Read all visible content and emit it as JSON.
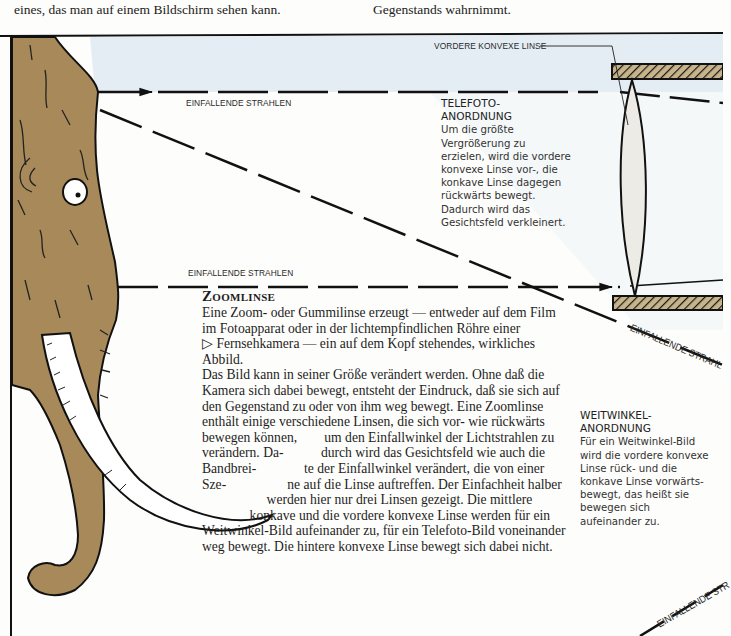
{
  "page_top": {
    "left_fragment": "eines, das man auf einem Bildschirm sehen kann.",
    "right_fragment": "Gegenstands wahrnimmt."
  },
  "diagram": {
    "labels": {
      "front_lens": "VORDERE KONVEXE LINSE",
      "rays_top": "EINFALLENDE STRAHLEN",
      "rays_middle": "EINFALLENDE STRAHLEN",
      "rays_diagonal_right": "EINFALLENDE STRAHL",
      "rays_bottom_right": "EINFALLENDE STR"
    },
    "colors": {
      "sky_band": "#e3edf3",
      "mammoth_fur": "#a88a5a",
      "tusk": "#ffffff",
      "lens_fill": "#ecebe6",
      "housing_hatch": "#c7b48a",
      "ink": "#111111"
    }
  },
  "telefoto": {
    "title": "TELEFOTO-\nANORDNUNG",
    "title_line1": "TELEFOTO-",
    "title_line2": "ANORDNUNG",
    "lines": [
      "Um die größte",
      "Vergrößerung zu",
      "erzielen, wird die vordere",
      "konvexe Linse vor-, die",
      "konkave Linse dagegen",
      "rückwärts bewegt.",
      "Dadurch wird das",
      "Gesichtsfeld verkleinert."
    ]
  },
  "weitwinkel": {
    "title_line1": "WEITWINKEL-",
    "title_line2": "ANORDNUNG",
    "lines": [
      "Für ein Weitwinkel-Bild",
      "wird die vordere konvexe",
      "Linse rück- und die",
      "konkave Linse vorwärts-",
      "bewegt, das heißt sie",
      "bewegen sich",
      "aufeinander zu."
    ]
  },
  "zoomlinse": {
    "heading": "Zoomlinse",
    "lines": [
      "Eine Zoom- oder Gummilinse erzeugt — entweder auf dem Film",
      "im Fotoapparat oder in der lichtempfindlichen Röhre einer",
      "▷ Fernsehkamera — ein auf dem Kopf stehendes, wirkliches",
      "Abbild.",
      "Das Bild kann in seiner Größe verändert werden. Ohne daß die",
      "Kamera sich dabei bewegt, entsteht der Eindruck, daß sie sich auf",
      "den Gegenstand zu oder von ihm weg bewegt. Eine Zoomlinse",
      "enthält einige verschiedene Linsen, die sich vor- wie rückwärts",
      "bewegen können,        um den Einfallwinkel der Lichtstrahlen zu",
      "verändern. Da-           durch wird das Gesichtsfeld wie auch die",
      "Bandbrei-              te der Einfallwinkel verändert, die von einer",
      "Sze-                  ne auf die Linse auftreffen. Der Einfachheit halber",
      "                   werden hier nur drei Linsen gezeigt. Die mittlere",
      "              konkave und die vordere konvexe Linse werden für ein",
      "Weitwinkel-Bild aufeinander zu, für ein Telefoto-Bild voneinander",
      "weg bewegt. Die hintere konvexe Linse bewegt sich dabei nicht."
    ]
  }
}
